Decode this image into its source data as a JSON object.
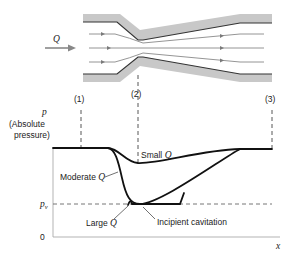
{
  "diagram": {
    "type": "venturi-pressure-distribution",
    "flow": {
      "label": "Q"
    },
    "sections": [
      {
        "id": "s1",
        "label": "(1)"
      },
      {
        "id": "s2",
        "label": "(2)"
      },
      {
        "id": "s3",
        "label": "(3)"
      }
    ],
    "axes": {
      "y_symbol": "p",
      "y_label_line1": "(Absolute",
      "y_label_line2": "pressure)",
      "x_label": "x",
      "origin_label": "0",
      "pv_label": "p",
      "pv_subscript": "v"
    },
    "curves": [
      {
        "id": "small",
        "label_text": "Small ",
        "label_q": "Q"
      },
      {
        "id": "moderate",
        "label_text": "Moderate ",
        "label_q": "Q"
      },
      {
        "id": "large",
        "label_text": "Large ",
        "label_q": "Q"
      }
    ],
    "annotations": {
      "incipient": "Incipient cavitation"
    },
    "colors": {
      "pipe_wall": "#c8c8c8",
      "pipe_edge": "#333333",
      "streamline": "#7a7a7a",
      "curve": "#111111",
      "dashed": "#555555"
    }
  }
}
